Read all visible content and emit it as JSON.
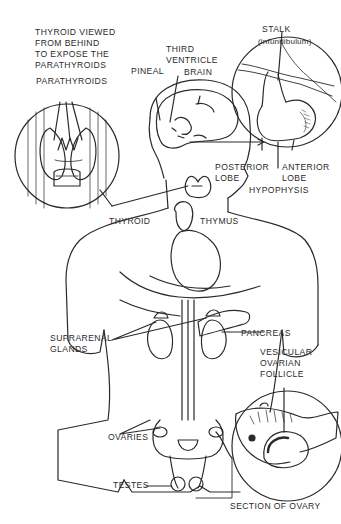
{
  "diagram": {
    "ink_color": "#2a2a2a",
    "background": "#ffffff",
    "labels": {
      "thyroid_behind": "THYROID VIEWED\nFROM BEHIND\nTO EXPOSE THE\nPARATHYROIDS",
      "parathyroids": "PARATHYROIDS",
      "pineal": "PINEAL",
      "third_ventricle": "THIRD\nVENTRICLE",
      "brain": "BRAIN",
      "stalk": "STALK",
      "infundibulum": "(infundibulum)",
      "posterior_lobe": "POSTERIOR\nLOBE",
      "anterior_lobe": "ANTERIOR\nLOBE",
      "hypophysis": "HYPOPHYSIS",
      "thyroid": "THYROID",
      "thymus": "THYMUS",
      "suprarenal_glands": "SUPRARENAL\nGLANDS",
      "pancreas": "PANCREAS",
      "vesicular_follicle": "VESICULAR\nOVARIAN\nFOLLICLE",
      "ovaries": "OVARIES",
      "testes": "TESTES",
      "section_of_ovary": "SECTION OF OVARY"
    },
    "insets": [
      {
        "name": "thyroid-rear-inset",
        "shape": "circle"
      },
      {
        "name": "hypophysis-inset",
        "shape": "circle"
      },
      {
        "name": "ovary-section-inset",
        "shape": "circle"
      }
    ]
  }
}
